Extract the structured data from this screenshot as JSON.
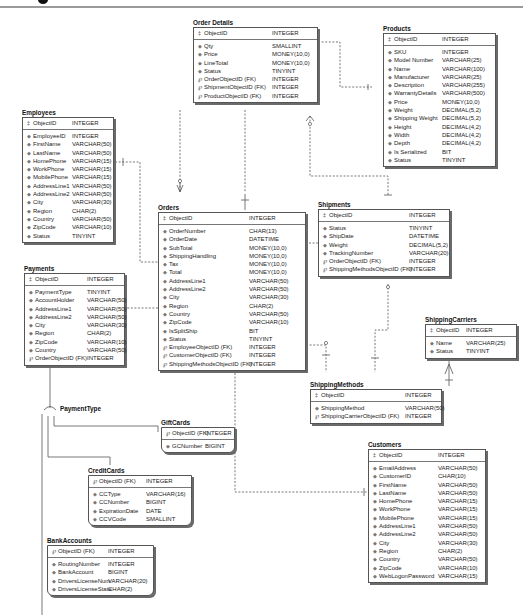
{
  "diagram": {
    "type": "entity-relationship",
    "subtype_label": "PaymentType",
    "icons": {
      "primary_key": "key-icon",
      "attribute": "diamond-icon",
      "foreign_key": "foreign-key-icon"
    }
  },
  "entities": {
    "order_details": {
      "title": "Order Details",
      "pk": {
        "name": "ObjectID",
        "type": "INTEGER"
      },
      "attributes": [
        {
          "name": "Qty",
          "type": "SMALLINT",
          "kind": "attr"
        },
        {
          "name": "Price",
          "type": "MONEY(10,0)",
          "kind": "attr"
        },
        {
          "name": "LineTotal",
          "type": "MONEY(10,0)",
          "kind": "attr"
        },
        {
          "name": "Status",
          "type": "TINYINT",
          "kind": "attr"
        },
        {
          "name": "OrderObjectID (FK)",
          "type": "INTEGER",
          "kind": "fk"
        },
        {
          "name": "ShipmentObjectID (FK)",
          "type": "INTEGER",
          "kind": "fk"
        },
        {
          "name": "ProductObjectID (FK)",
          "type": "INTEGER",
          "kind": "fk"
        }
      ]
    },
    "products": {
      "title": "Products",
      "pk": {
        "name": "ObjectID",
        "type": "INTEGER"
      },
      "attributes": [
        {
          "name": "SKU",
          "type": "INTEGER",
          "kind": "attr"
        },
        {
          "name": "Model Number",
          "type": "VARCHAR(25)",
          "kind": "attr"
        },
        {
          "name": "Name",
          "type": "VARCHAR(100)",
          "kind": "attr"
        },
        {
          "name": "Manufacturer",
          "type": "VARCHAR(25)",
          "kind": "attr"
        },
        {
          "name": "Description",
          "type": "VARCHAR(255)",
          "kind": "attr"
        },
        {
          "name": "WarrantyDetails",
          "type": "VARCHAR(500)",
          "kind": "attr"
        },
        {
          "name": "Price",
          "type": "MONEY(10,0)",
          "kind": "attr"
        },
        {
          "name": "Weight",
          "type": "DECIMAL(5,2)",
          "kind": "attr"
        },
        {
          "name": "Shipping Weight",
          "type": "DECIMAL(5,2)",
          "kind": "attr"
        },
        {
          "name": "Height",
          "type": "DECIMAL(4,2)",
          "kind": "attr"
        },
        {
          "name": "Width",
          "type": "DECIMAL(4,2)",
          "kind": "attr"
        },
        {
          "name": "Depth",
          "type": "DECIMAL(4,2)",
          "kind": "attr"
        },
        {
          "name": "Is Serialized",
          "type": "BIT",
          "kind": "attr"
        },
        {
          "name": "Status",
          "type": "TINYINT",
          "kind": "attr"
        }
      ]
    },
    "employees": {
      "title": "Employees",
      "pk": {
        "name": "ObjectID",
        "type": "INTEGER"
      },
      "attributes": [
        {
          "name": "EmployeeID",
          "type": "INTEGER",
          "kind": "attr"
        },
        {
          "name": "FirstName",
          "type": "VARCHAR(50)",
          "kind": "attr"
        },
        {
          "name": "LastName",
          "type": "VARCHAR(50)",
          "kind": "attr"
        },
        {
          "name": "HomePhone",
          "type": "VARCHAR(15)",
          "kind": "attr"
        },
        {
          "name": "WorkPhone",
          "type": "VARCHAR(15)",
          "kind": "attr"
        },
        {
          "name": "MobilePhone",
          "type": "VARCHAR(15)",
          "kind": "attr"
        },
        {
          "name": "AddressLine1",
          "type": "VARCHAR(50)",
          "kind": "attr"
        },
        {
          "name": "AddressLine2",
          "type": "VARCHAR(50)",
          "kind": "attr"
        },
        {
          "name": "City",
          "type": "VARCHAR(30)",
          "kind": "attr"
        },
        {
          "name": "Region",
          "type": "CHAR(2)",
          "kind": "attr"
        },
        {
          "name": "Country",
          "type": "VARCHAR(50)",
          "kind": "attr"
        },
        {
          "name": "ZipCode",
          "type": "VARCHAR(10)",
          "kind": "attr"
        },
        {
          "name": "Status",
          "type": "TINYINT",
          "kind": "attr"
        }
      ]
    },
    "orders": {
      "title": "Orders",
      "pk": {
        "name": "ObjectID",
        "type": "INTEGER"
      },
      "attributes": [
        {
          "name": "OrderNumber",
          "type": "CHAR(13)",
          "kind": "attr"
        },
        {
          "name": "OrderDate",
          "type": "DATETIME",
          "kind": "attr"
        },
        {
          "name": "SubTotal",
          "type": "MONEY(10,0)",
          "kind": "attr"
        },
        {
          "name": "ShippingHandling",
          "type": "MONEY(10,0)",
          "kind": "attr"
        },
        {
          "name": "Tax",
          "type": "MONEY(10,0)",
          "kind": "attr"
        },
        {
          "name": "Total",
          "type": "MONEY(10,0)",
          "kind": "attr"
        },
        {
          "name": "AddressLine1",
          "type": "VARCHAR(50)",
          "kind": "attr"
        },
        {
          "name": "AddressLine2",
          "type": "VARCHAR(50)",
          "kind": "attr"
        },
        {
          "name": "City",
          "type": "VARCHAR(30)",
          "kind": "attr"
        },
        {
          "name": "Region",
          "type": "CHAR(2)",
          "kind": "attr"
        },
        {
          "name": "Country",
          "type": "VARCHAR(50)",
          "kind": "attr"
        },
        {
          "name": "ZipCode",
          "type": "VARCHAR(10)",
          "kind": "attr"
        },
        {
          "name": "IsSplitShip",
          "type": "BIT",
          "kind": "attr"
        },
        {
          "name": "Status",
          "type": "TINYINT",
          "kind": "attr"
        },
        {
          "name": "EmployeeObjectID (FK)",
          "type": "INTEGER",
          "kind": "fk"
        },
        {
          "name": "CustomerObjectID (FK)",
          "type": "INTEGER",
          "kind": "fk"
        },
        {
          "name": "ShippingMethodsObjectID (FK)",
          "type": "INTEGER",
          "kind": "fk"
        }
      ]
    },
    "shipments": {
      "title": "Shipments",
      "pk": {
        "name": "ObjectID",
        "type": "INTEGER"
      },
      "attributes": [
        {
          "name": "Status",
          "type": "TINYINT",
          "kind": "attr"
        },
        {
          "name": "ShipDate",
          "type": "DATETIME",
          "kind": "attr"
        },
        {
          "name": "Weight",
          "type": "DECIMAL(5,2)",
          "kind": "attr"
        },
        {
          "name": "TrackingNumber",
          "type": "VARCHAR(20)",
          "kind": "attr"
        },
        {
          "name": "OrderObjectID (FK)",
          "type": "INTEGER",
          "kind": "fk"
        },
        {
          "name": "ShippingMethodsObjectID (FK)",
          "type": "INTEGER",
          "kind": "fk"
        }
      ]
    },
    "payments": {
      "title": "Payments",
      "pk": {
        "name": "ObjectID",
        "type": "INTEGER"
      },
      "attributes": [
        {
          "name": "PaymentType",
          "type": "TINYINT",
          "kind": "attr"
        },
        {
          "name": "AccountHolder",
          "type": "VARCHAR(50)",
          "kind": "attr"
        },
        {
          "name": "AddressLine1",
          "type": "VARCHAR(50)",
          "kind": "attr"
        },
        {
          "name": "AddressLine2",
          "type": "VARCHAR(50)",
          "kind": "attr"
        },
        {
          "name": "City",
          "type": "VARCHAR(30)",
          "kind": "attr"
        },
        {
          "name": "Region",
          "type": "CHAR(2)",
          "kind": "attr"
        },
        {
          "name": "ZipCode",
          "type": "VARCHAR(10)",
          "kind": "attr"
        },
        {
          "name": "Country",
          "type": "VARCHAR(50)",
          "kind": "attr"
        },
        {
          "name": "OrderObjectID (FK)",
          "type": "INTEGER",
          "kind": "fk"
        }
      ]
    },
    "shipping_carriers": {
      "title": "ShippingCarriers",
      "pk": {
        "name": "ObjectID",
        "type": "INTEGER"
      },
      "attributes": [
        {
          "name": "Name",
          "type": "VARCHAR(25)",
          "kind": "attr"
        },
        {
          "name": "Status",
          "type": "TINYINT",
          "kind": "attr"
        }
      ]
    },
    "shipping_methods": {
      "title": "ShippingMethods",
      "pk": {
        "name": "ObjectID",
        "type": "INTEGER"
      },
      "attributes": [
        {
          "name": "ShippingMethod",
          "type": "VARCHAR(50)",
          "kind": "attr"
        },
        {
          "name": "ShippingCarrierObjectID (FK)",
          "type": "INTEGER",
          "kind": "fk"
        }
      ]
    },
    "gift_cards": {
      "title": "GiftCards",
      "pk": {
        "name": "ObjectID (FK)",
        "type": "INTEGER",
        "kind": "fk"
      },
      "attributes": [
        {
          "name": "GCNumber",
          "type": "BIGINT",
          "kind": "attr"
        }
      ]
    },
    "credit_cards": {
      "title": "CreditCards",
      "pk": {
        "name": "ObjectID (FK)",
        "type": "INTEGER",
        "kind": "fk"
      },
      "attributes": [
        {
          "name": "CCType",
          "type": "VARCHAR(16)",
          "kind": "attr"
        },
        {
          "name": "CCNumber",
          "type": "BIGINT",
          "kind": "attr"
        },
        {
          "name": "ExpirationDate",
          "type": "DATE",
          "kind": "attr"
        },
        {
          "name": "CCVCode",
          "type": "SMALLINT",
          "kind": "attr"
        }
      ]
    },
    "bank_accounts": {
      "title": "BankAccounts",
      "pk": {
        "name": "ObjectID (FK)",
        "type": "INTEGER",
        "kind": "fk"
      },
      "attributes": [
        {
          "name": "RoutingNumber",
          "type": "INTEGER",
          "kind": "attr"
        },
        {
          "name": "BankAccount",
          "type": "BIGINT",
          "kind": "attr"
        },
        {
          "name": "DriversLicenseNum",
          "type": "VARCHAR(20)",
          "kind": "attr"
        },
        {
          "name": "DriversLicenseState",
          "type": "CHAR(2)",
          "kind": "attr"
        }
      ]
    },
    "customers": {
      "title": "Customers",
      "pk": {
        "name": "ObjectID",
        "type": "INTEGER"
      },
      "attributes": [
        {
          "name": "EmailAddress",
          "type": "VARCHAR(50)",
          "kind": "attr"
        },
        {
          "name": "CustomerID",
          "type": "CHAR(10)",
          "kind": "attr"
        },
        {
          "name": "FirstName",
          "type": "VARCHAR(50)",
          "kind": "attr"
        },
        {
          "name": "LastName",
          "type": "VARCHAR(50)",
          "kind": "attr"
        },
        {
          "name": "HomePhone",
          "type": "VARCHAR(15)",
          "kind": "attr"
        },
        {
          "name": "WorkPhone",
          "type": "VARCHAR(15)",
          "kind": "attr"
        },
        {
          "name": "MobilePhone",
          "type": "VARCHAR(15)",
          "kind": "attr"
        },
        {
          "name": "AddressLine1",
          "type": "VARCHAR(50)",
          "kind": "attr"
        },
        {
          "name": "AddressLine2",
          "type": "VARCHAR(50)",
          "kind": "attr"
        },
        {
          "name": "City",
          "type": "VARCHAR(30)",
          "kind": "attr"
        },
        {
          "name": "Region",
          "type": "CHAR(2)",
          "kind": "attr"
        },
        {
          "name": "Country",
          "type": "VARCHAR(50)",
          "kind": "attr"
        },
        {
          "name": "ZipCode",
          "type": "VARCHAR(10)",
          "kind": "attr"
        },
        {
          "name": "WebLogonPassword",
          "type": "VARCHAR(15)",
          "kind": "attr"
        }
      ]
    }
  },
  "relationships": [
    {
      "from": "Orders",
      "to": "Order Details",
      "style": "identifying-dashed"
    },
    {
      "from": "Shipments",
      "to": "Order Details",
      "style": "dashed"
    },
    {
      "from": "Products",
      "to": "Order Details",
      "style": "dashed"
    },
    {
      "from": "Employees",
      "to": "Orders",
      "style": "dashed"
    },
    {
      "from": "Orders",
      "to": "Shipments",
      "style": "dashed"
    },
    {
      "from": "Orders",
      "to": "Payments",
      "style": "dashed"
    },
    {
      "from": "ShippingMethods",
      "to": "Orders",
      "style": "dashed"
    },
    {
      "from": "ShippingMethods",
      "to": "Shipments",
      "style": "dashed"
    },
    {
      "from": "ShippingCarriers",
      "to": "ShippingMethods",
      "style": "solid"
    },
    {
      "from": "Customers",
      "to": "Orders",
      "style": "dashed"
    },
    {
      "from": "Payments",
      "to": "GiftCards",
      "style": "subtype"
    },
    {
      "from": "Payments",
      "to": "CreditCards",
      "style": "subtype"
    },
    {
      "from": "Payments",
      "to": "BankAccounts",
      "style": "subtype"
    }
  ]
}
